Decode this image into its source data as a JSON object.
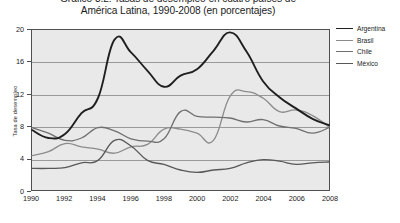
{
  "title": {
    "line_1": "Gráfico 3.2: Tasas de desempleo en cuatro países de",
    "line_2": "América Latina, 1990-2008 (en porcentajes)"
  },
  "legend": {
    "position": "right",
    "items": [
      {
        "label": "Argentina",
        "color": "#1f1f1f",
        "width": 1.9
      },
      {
        "label": "Brasil",
        "color": "#8c8c8c",
        "width": 1.4
      },
      {
        "label": "Chile",
        "color": "#707070",
        "width": 1.4
      },
      {
        "label": "México",
        "color": "#585858",
        "width": 1.5
      }
    ]
  },
  "chart_data": {
    "type": "line",
    "title": "Gráfico 3.2: Tasas de desempleo en cuatro países de América Latina, 1990-2008 (en porcentajes)",
    "xlabel": "",
    "ylabel": "Tasa de desempleo",
    "xlim": [
      1990,
      2008
    ],
    "ylim": [
      0,
      20
    ],
    "yticks": [
      0,
      4,
      8,
      12,
      16,
      20
    ],
    "xticks": [
      1990,
      1992,
      1994,
      1996,
      1998,
      2000,
      2002,
      2004,
      2006,
      2008
    ],
    "xtick_labels": [
      "1990",
      "1992",
      "1994",
      "1996",
      "1998",
      "2000",
      "2002",
      "2004",
      "2006",
      "2008"
    ],
    "ytick_labels": [
      "0",
      "4",
      "8",
      "12",
      "16",
      "20"
    ],
    "grid": "horizontal",
    "plot_background": "#e9e9e9",
    "x": [
      1990,
      1991,
      1992,
      1993,
      1994,
      1995,
      1996,
      1997,
      1998,
      1999,
      2000,
      2001,
      2002,
      2003,
      2004,
      2005,
      2006,
      2007,
      2008
    ],
    "series": [
      {
        "name": "Argentina",
        "color": "#1f1f1f",
        "values": [
          7.5,
          6.5,
          7.0,
          9.6,
          11.5,
          18.8,
          17.2,
          14.9,
          12.9,
          14.3,
          15.1,
          17.4,
          19.7,
          17.3,
          13.6,
          11.6,
          10.2,
          8.9,
          8.1
        ]
      },
      {
        "name": "Brasil",
        "color": "#8c8c8c",
        "values": [
          4.3,
          4.8,
          5.8,
          5.4,
          5.1,
          4.6,
          5.4,
          5.7,
          7.6,
          7.6,
          7.1,
          6.2,
          11.7,
          12.3,
          11.5,
          9.8,
          10.0,
          9.3,
          7.9
        ]
      },
      {
        "name": "Chile",
        "color": "#707070",
        "values": [
          7.8,
          7.1,
          6.2,
          6.5,
          7.8,
          7.4,
          6.4,
          6.1,
          6.4,
          9.8,
          9.2,
          9.1,
          9.0,
          8.5,
          8.8,
          8.0,
          7.7,
          7.1,
          7.8
        ]
      },
      {
        "name": "México",
        "color": "#585858",
        "values": [
          2.7,
          2.7,
          2.8,
          3.4,
          3.7,
          6.2,
          5.5,
          3.7,
          3.2,
          2.5,
          2.2,
          2.5,
          2.7,
          3.4,
          3.8,
          3.6,
          3.2,
          3.4,
          3.5
        ]
      }
    ]
  }
}
